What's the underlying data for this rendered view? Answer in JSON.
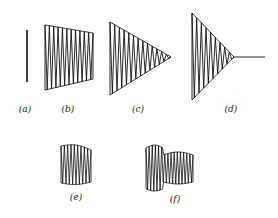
{
  "figure": {
    "panels": [
      {
        "id": "a",
        "label": "(a)",
        "shape": "vertical-line"
      },
      {
        "id": "b",
        "label": "(b)",
        "shape": "tapering-trapezoid-zigzag"
      },
      {
        "id": "c",
        "label": "(c)",
        "shape": "triangle-zigzag-to-point"
      },
      {
        "id": "d",
        "label": "(d)",
        "shape": "triangle-zigzag-with-tail-line"
      },
      {
        "id": "e",
        "label": "(e)",
        "shape": "barrel-zigzag"
      },
      {
        "id": "f",
        "label": "(f)",
        "shape": "double-lobed-zigzag"
      }
    ],
    "stroke_color": "#111111"
  }
}
